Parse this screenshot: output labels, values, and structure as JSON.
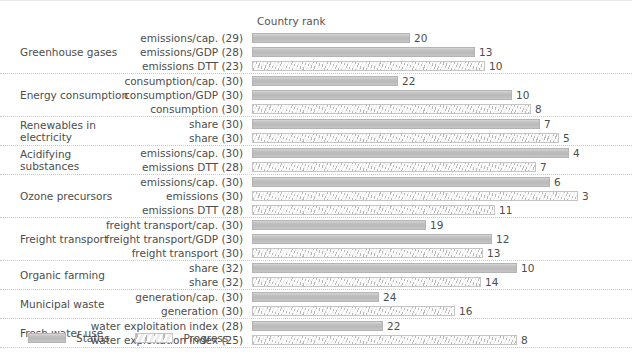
{
  "chart_data": {
    "type": "bar",
    "title": "",
    "axis_title": "Country rank",
    "xlabel": "Country rank",
    "ylabel": "",
    "orientation": "horizontal",
    "grid": false,
    "legend_position": "bottom-left",
    "bar_scale_note": "Bar length is inversely proportional to rank: longer bar = better (lower) rank.",
    "legend": [
      {
        "key": "status",
        "label": "Status"
      },
      {
        "key": "progress",
        "label": "Progress"
      }
    ],
    "groups": [
      {
        "name": "Greenhouse gases",
        "rows": [
          {
            "label": "emissions/cap. (29)",
            "indicator": "emissions/cap.",
            "total": 29,
            "value": 20,
            "series": "status"
          },
          {
            "label": "emissions/GDP (28)",
            "indicator": "emissions/GDP",
            "total": 28,
            "value": 13,
            "series": "status"
          },
          {
            "label": "emissions DTT (23)",
            "indicator": "emissions DTT",
            "total": 23,
            "value": 10,
            "series": "progress"
          }
        ]
      },
      {
        "name": "Energy consumption",
        "rows": [
          {
            "label": "consumption/cap. (30)",
            "indicator": "consumption/cap.",
            "total": 30,
            "value": 22,
            "series": "status"
          },
          {
            "label": "consumption/GDP (30)",
            "indicator": "consumption/GDP",
            "total": 30,
            "value": 10,
            "series": "status"
          },
          {
            "label": "consumption (30)",
            "indicator": "consumption",
            "total": 30,
            "value": 8,
            "series": "progress"
          }
        ]
      },
      {
        "name": "Renewables in electricity",
        "rows": [
          {
            "label": "share (30)",
            "indicator": "share",
            "total": 30,
            "value": 7,
            "series": "status"
          },
          {
            "label": "share (30)",
            "indicator": "share",
            "total": 30,
            "value": 5,
            "series": "progress"
          }
        ]
      },
      {
        "name": "Acidifying substances",
        "rows": [
          {
            "label": "emissions/cap. (30)",
            "indicator": "emissions/cap.",
            "total": 30,
            "value": 4,
            "series": "status"
          },
          {
            "label": "emissions DTT (28)",
            "indicator": "emissions DTT",
            "total": 28,
            "value": 7,
            "series": "progress"
          }
        ]
      },
      {
        "name": "Ozone precursors",
        "rows": [
          {
            "label": "emissions/cap. (30)",
            "indicator": "emissions/cap.",
            "total": 30,
            "value": 6,
            "series": "status"
          },
          {
            "label": "emissions (30)",
            "indicator": "emissions",
            "total": 30,
            "value": 3,
            "series": "progress"
          },
          {
            "label": "emissions DTT (28)",
            "indicator": "emissions DTT",
            "total": 28,
            "value": 11,
            "series": "progress"
          }
        ]
      },
      {
        "name": "Freight transport",
        "rows": [
          {
            "label": "freight transport/cap. (30)",
            "indicator": "freight transport/cap.",
            "total": 30,
            "value": 19,
            "series": "status"
          },
          {
            "label": "freight transport/GDP (30)",
            "indicator": "freight transport/GDP",
            "total": 30,
            "value": 12,
            "series": "status"
          },
          {
            "label": "freight transport (30)",
            "indicator": "freight transport",
            "total": 30,
            "value": 13,
            "series": "progress"
          }
        ]
      },
      {
        "name": "Organic farming",
        "rows": [
          {
            "label": "share (32)",
            "indicator": "share",
            "total": 32,
            "value": 10,
            "series": "status"
          },
          {
            "label": "share (32)",
            "indicator": "share",
            "total": 32,
            "value": 14,
            "series": "progress"
          }
        ]
      },
      {
        "name": "Municipal waste",
        "rows": [
          {
            "label": "generation/cap. (30)",
            "indicator": "generation/cap.",
            "total": 30,
            "value": 24,
            "series": "status"
          },
          {
            "label": "generation (30)",
            "indicator": "generation",
            "total": 30,
            "value": 16,
            "series": "progress"
          }
        ]
      },
      {
        "name": "Fresh water use",
        "rows": [
          {
            "label": "water exploitation index (28)",
            "indicator": "water exploitation index",
            "total": 28,
            "value": 22,
            "series": "status"
          },
          {
            "label": "water exploitation index (25)",
            "indicator": "water exploitation index",
            "total": 25,
            "value": 8,
            "series": "progress"
          }
        ]
      }
    ],
    "colors": {
      "status_bar": "#c0c0c0",
      "progress_bar": "#ececec",
      "bar_border": "#b4b4b4",
      "text": "#4d4d4d",
      "separator": "#c9c9c9"
    }
  }
}
